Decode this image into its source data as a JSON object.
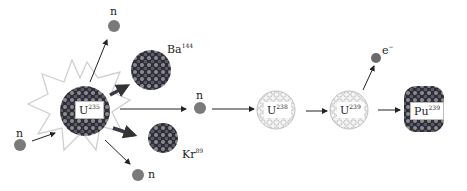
{
  "diagram": {
    "colors": {
      "neutron": "#7a7a7a",
      "nucleus_dark": "#2e2e3a",
      "nucleus_mid": "#6e6e6e",
      "nucleus_light": "#9a9a9a",
      "fertile_nucleus": "#e6e6e6",
      "arrow": "#222222",
      "starburst": "#c8c8c8"
    },
    "labels": {
      "n_incoming": "n",
      "n_top": "n",
      "n_right": "n",
      "n_bottom": "n",
      "u235": {
        "symbol": "U",
        "mass": "235"
      },
      "ba144": {
        "symbol": "Ba",
        "mass": "144"
      },
      "kr89": {
        "symbol": "Kr",
        "mass": "89"
      },
      "u238": {
        "symbol": "U",
        "mass": "238"
      },
      "u239": {
        "symbol": "U",
        "mass": "239"
      },
      "pu239": {
        "symbol": "Pu",
        "mass": "239"
      },
      "electron": {
        "symbol": "e",
        "charge": "−"
      }
    }
  }
}
